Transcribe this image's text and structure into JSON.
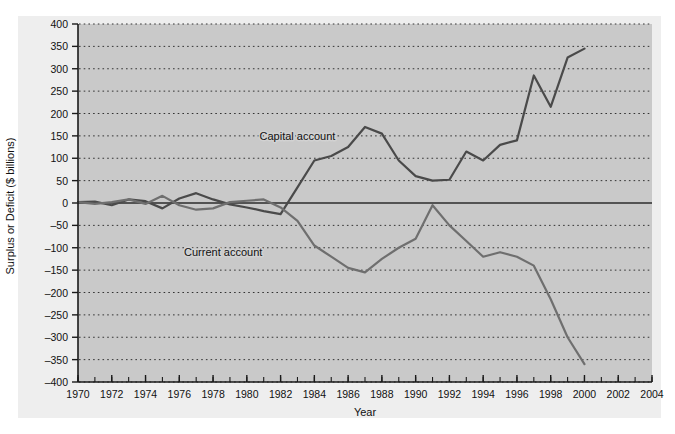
{
  "chart_data": {
    "type": "line",
    "title": "",
    "xlabel": "Year",
    "ylabel": "Surplus or Deficit ($ billions)",
    "xlim": [
      1970,
      2004
    ],
    "ylim": [
      -400,
      400
    ],
    "ytick_step": 50,
    "xtick_step": 2,
    "xminor_step": 1,
    "grid": "horizontal-dotted",
    "legend_position": "inline-annotations",
    "zero_line": true,
    "yticks": [
      400,
      350,
      300,
      250,
      200,
      150,
      100,
      50,
      0,
      -50,
      -100,
      -150,
      -200,
      -250,
      -300,
      -350,
      -400
    ],
    "ytick_labels": [
      "400",
      "350",
      "300",
      "250",
      "200",
      "150",
      "100",
      "50",
      "0",
      "–50",
      "–100",
      "–150",
      "–200",
      "–250",
      "–300",
      "–350",
      "–400"
    ],
    "xticks": [
      1970,
      1972,
      1974,
      1976,
      1978,
      1980,
      1982,
      1984,
      1986,
      1988,
      1990,
      1992,
      1994,
      1996,
      1998,
      2000,
      2002,
      2004
    ],
    "xtick_labels": [
      "1970",
      "1972",
      "1974",
      "1976",
      "1978",
      "1980",
      "1982",
      "1984",
      "1986",
      "1988",
      "1990",
      "1992",
      "1994",
      "1996",
      "1998",
      "2000",
      "2002",
      "2004"
    ],
    "x": [
      1970,
      1971,
      1972,
      1973,
      1974,
      1975,
      1976,
      1977,
      1978,
      1979,
      1980,
      1981,
      1982,
      1983,
      1984,
      1985,
      1986,
      1987,
      1988,
      1989,
      1990,
      1991,
      1992,
      1993,
      1994,
      1995,
      1996,
      1997,
      1998,
      1999,
      2000
    ],
    "series": [
      {
        "name": "Capital account",
        "color": "#4a4a4a",
        "label_x": 1983.0,
        "label_y": 140,
        "values": [
          2,
          3,
          -5,
          8,
          4,
          -12,
          10,
          22,
          8,
          -3,
          -10,
          -18,
          -25,
          35,
          95,
          105,
          125,
          170,
          155,
          95,
          60,
          50,
          52,
          115,
          95,
          130,
          140,
          285,
          215,
          325,
          345
        ]
      },
      {
        "name": "Current account",
        "color": "#6f6f6f",
        "label_x": 1978.6,
        "label_y": -118,
        "values": [
          2,
          -2,
          2,
          8,
          -2,
          16,
          -5,
          -15,
          -12,
          2,
          5,
          8,
          -10,
          -40,
          -95,
          -120,
          -145,
          -155,
          -125,
          -100,
          -80,
          -5,
          -50,
          -85,
          -120,
          -110,
          -120,
          -140,
          -215,
          -300,
          -360
        ]
      }
    ],
    "annotations": [
      {
        "text": "Capital account"
      },
      {
        "text": "Current account"
      }
    ]
  }
}
